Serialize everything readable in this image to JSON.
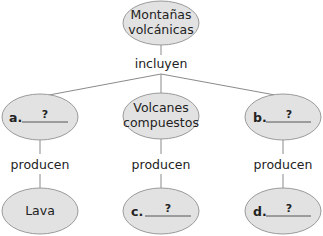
{
  "diagram": {
    "type": "concept-map",
    "colors": {
      "node_fill": "#e2e2e2",
      "node_stroke": "#9a9a9a",
      "line": "#8a8a8a",
      "text": "#222222"
    },
    "root": {
      "line1": "Montañas",
      "line2": "volcánicas"
    },
    "root_link": "incluyen",
    "level1": [
      {
        "letter": "a.",
        "blank": "?"
      },
      {
        "line1": "Volcanes",
        "line2": "compuestos"
      },
      {
        "letter": "b.",
        "blank": "?"
      }
    ],
    "level1_link": "producen",
    "level2": [
      {
        "text": "Lava"
      },
      {
        "letter": "c.",
        "blank": "?"
      },
      {
        "letter": "d.",
        "blank": "?"
      }
    ]
  }
}
